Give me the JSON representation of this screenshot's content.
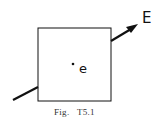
{
  "figure": {
    "caption": "Fig.   T5.1",
    "field_label": "E",
    "charge_label": "e"
  },
  "colors": {
    "stroke": "#111111",
    "caption": "#333333"
  }
}
